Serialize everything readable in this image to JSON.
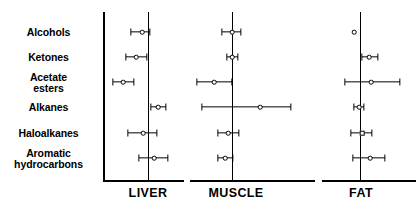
{
  "figure": {
    "type": "forest-plot",
    "background_color": "#ffffff",
    "marker_color": "#000000"
  },
  "row_labels": [
    "Alcohols",
    "Ketones",
    "Acetate\nesters",
    "Alkanes",
    "Haloalkanes",
    "Aromatic\nhydrocarbons"
  ],
  "panels": [
    {
      "title": "LIVER",
      "title_x": 148,
      "axis_start_x": 103,
      "axis_end_x": 184,
      "refline_x": 148
    },
    {
      "title": "MUSCLE",
      "title_x": 236,
      "axis_start_x": 190,
      "axis_end_x": 315,
      "refline_x": 232
    },
    {
      "title": "FAT",
      "title_x": 361,
      "axis_start_x": 322,
      "axis_end_x": 416,
      "refline_x": 360
    }
  ],
  "axis": {
    "top_y": 12,
    "bottom_y": 180,
    "left_spine_x": 103
  },
  "chart_data": {
    "type": "scatter",
    "title": "",
    "xlabel": "",
    "ylabel": "",
    "grid": false,
    "legend": "none",
    "categories": [
      "Alcohols",
      "Ketones",
      "Acetate esters",
      "Alkanes",
      "Haloalkanes",
      "Aromatic hydrocarbons"
    ],
    "panel_names": [
      "LIVER",
      "MUSCLE",
      "FAT"
    ],
    "row_y_px": [
      32,
      57,
      82,
      107,
      133,
      158
    ],
    "series": [
      {
        "name": "LIVER",
        "points": [
          {
            "category": "Alcohols",
            "estimate_px": 142,
            "low_px": 131,
            "high_px": 150,
            "marker": "circle"
          },
          {
            "category": "Ketones",
            "estimate_px": 136,
            "low_px": 126,
            "high_px": 147,
            "marker": "circle"
          },
          {
            "category": "Acetate esters",
            "estimate_px": 123,
            "low_px": 113,
            "high_px": 134,
            "marker": "circle"
          },
          {
            "category": "Alkanes",
            "estimate_px": 158,
            "low_px": 151,
            "high_px": 166,
            "marker": "circle"
          },
          {
            "category": "Haloalkanes",
            "estimate_px": 143,
            "low_px": 128,
            "high_px": 157,
            "marker": "circle"
          },
          {
            "category": "Aromatic hydrocarbons",
            "estimate_px": 154,
            "low_px": 139,
            "high_px": 168,
            "marker": "circle"
          }
        ]
      },
      {
        "name": "MUSCLE",
        "points": [
          {
            "category": "Alcohols",
            "estimate_px": 232,
            "low_px": 222,
            "high_px": 241,
            "marker": "circle"
          },
          {
            "category": "Ketones",
            "estimate_px": 232,
            "low_px": 227,
            "high_px": 238,
            "marker": "circle"
          },
          {
            "category": "Acetate esters",
            "estimate_px": 214,
            "low_px": 197,
            "high_px": 232,
            "marker": "circle"
          },
          {
            "category": "Alkanes",
            "estimate_px": 260,
            "low_px": 202,
            "high_px": 291,
            "marker": "circle"
          },
          {
            "category": "Haloalkanes",
            "estimate_px": 228,
            "low_px": 218,
            "high_px": 239,
            "marker": "circle"
          },
          {
            "category": "Aromatic hydrocarbons",
            "estimate_px": 225,
            "low_px": 218,
            "high_px": 233,
            "marker": "circle"
          }
        ]
      },
      {
        "name": "FAT",
        "points": [
          {
            "category": "Alcohols",
            "estimate_px": 354,
            "low_px": 354,
            "high_px": 354,
            "marker": "circle"
          },
          {
            "category": "Ketones",
            "estimate_px": 369,
            "low_px": 362,
            "high_px": 378,
            "marker": "circle"
          },
          {
            "category": "Acetate esters",
            "estimate_px": 371,
            "low_px": 345,
            "high_px": 400,
            "marker": "circle"
          },
          {
            "category": "Alkanes",
            "estimate_px": 359,
            "low_px": 354,
            "high_px": 364,
            "marker": "circle"
          },
          {
            "category": "Haloalkanes",
            "estimate_px": 362,
            "low_px": 351,
            "high_px": 372,
            "marker": "square"
          },
          {
            "category": "Aromatic hydrocarbons",
            "estimate_px": 370,
            "low_px": 353,
            "high_px": 385,
            "marker": "circle"
          }
        ]
      }
    ]
  }
}
